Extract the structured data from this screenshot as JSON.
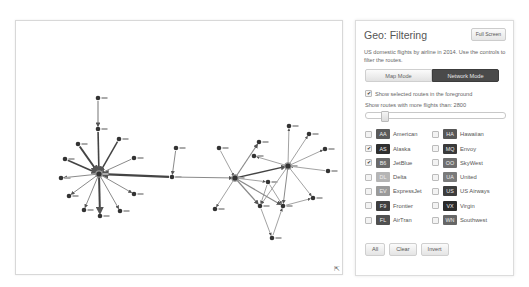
{
  "panel": {
    "title": "Geo: Filtering",
    "fullscreen_label": "Full Screen",
    "description": "US domestic flights by airline in 2014. Use the controls to filter the routes.",
    "modes": [
      {
        "label": "Map Mode",
        "active": false
      },
      {
        "label": "Network Mode",
        "active": true
      }
    ],
    "foreground_checkbox": {
      "label": "Show selected routes in the foreground",
      "checked": true
    },
    "threshold": {
      "label": "Show routes with more flights than: 2800",
      "value": 2800,
      "slider_fraction": 0.13
    },
    "airlines": [
      {
        "code": "AA",
        "name": "American",
        "checked": false,
        "color": "#5a5a5a"
      },
      {
        "code": "HA",
        "name": "Hawaiian",
        "checked": false,
        "color": "#575757"
      },
      {
        "code": "AS",
        "name": "Alaska",
        "checked": true,
        "color": "#2f2f2f"
      },
      {
        "code": "MQ",
        "name": "Envoy",
        "checked": false,
        "color": "#3a3a3a"
      },
      {
        "code": "B6",
        "name": "JetBlue",
        "checked": true,
        "color": "#6a6a6a"
      },
      {
        "code": "OO",
        "name": "SkyWest",
        "checked": false,
        "color": "#6e6e6e"
      },
      {
        "code": "DL",
        "name": "Delta",
        "checked": false,
        "color": "#b5b5b5"
      },
      {
        "code": "UA",
        "name": "United",
        "checked": false,
        "color": "#7a7a7a"
      },
      {
        "code": "EV",
        "name": "ExpressJet",
        "checked": false,
        "color": "#9a9a9a"
      },
      {
        "code": "US",
        "name": "US Airways",
        "checked": false,
        "color": "#3d3d3d"
      },
      {
        "code": "F9",
        "name": "Frontier",
        "checked": false,
        "color": "#3f3f3f"
      },
      {
        "code": "VX",
        "name": "Virgin",
        "checked": false,
        "color": "#2a2a2a"
      },
      {
        "code": "FL",
        "name": "AirTran",
        "checked": false,
        "color": "#505050"
      },
      {
        "code": "WN",
        "name": "Southwest",
        "checked": false,
        "color": "#666666"
      }
    ],
    "actions": {
      "all": "All",
      "clear": "Clear",
      "invert": "Invert"
    }
  },
  "network": {
    "icons": {
      "resize": "resize-corner-icon"
    },
    "checkmark_glyph": "✔",
    "resize_glyph": "⇱"
  }
}
